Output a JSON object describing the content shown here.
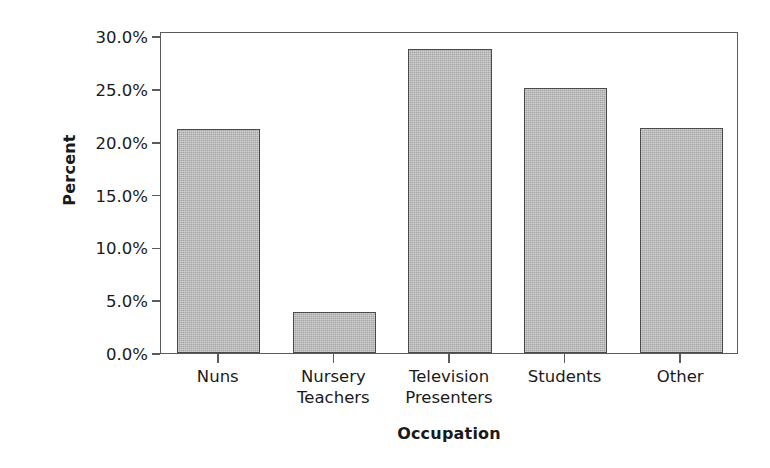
{
  "chart_data": {
    "type": "bar",
    "title": "",
    "xlabel": "Occupation",
    "ylabel": "Percent",
    "categories": [
      "Nuns",
      "Nursery\nTeachers",
      "Television\nPresenters",
      "Students",
      "Other"
    ],
    "values": [
      21.2,
      3.9,
      28.8,
      25.1,
      21.3
    ],
    "value_labels": [
      "21.2%",
      "3.9%",
      "28.8%",
      "25.1%",
      "21.3%"
    ],
    "ylim": [
      0.0,
      30.5
    ],
    "ytick_values": [
      0.0,
      5.0,
      10.0,
      15.0,
      20.0,
      25.0,
      30.0
    ],
    "ytick_labels": [
      "0.0%",
      "5.0%",
      "10.0%",
      "15.0%",
      "20.0%",
      "25.0%",
      "30.0%"
    ],
    "grid": false,
    "legend": false,
    "legend_position": "none",
    "bar_color": "#b6b6b6",
    "bar_edge_color": "#4a4a4a",
    "axis_color": "#5b5b5b",
    "text_color": "#1a1a1a",
    "background_color": "#ffffff"
  }
}
